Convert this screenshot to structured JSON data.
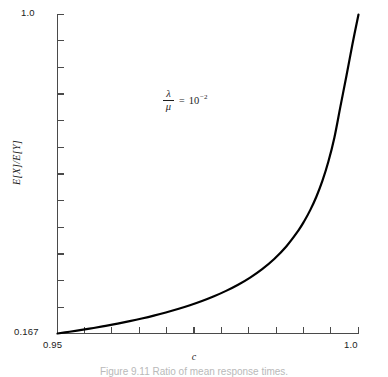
{
  "figure": {
    "caption": "Figure 9.11  Ratio of mean response times.",
    "annotation": {
      "numerator": "λ",
      "denominator": "μ",
      "equals": "=",
      "base": "10",
      "exponent": "−2",
      "full_text": "λ/μ = 10⁻²"
    }
  },
  "chart_data": {
    "type": "line",
    "title": "",
    "subtitle": "",
    "xlabel": "c",
    "ylabel": "E[X]/E[Y]",
    "xlim": [
      0.95,
      1.0
    ],
    "ylim": [
      0.167,
      1.0
    ],
    "x_tick_labels": [
      "0.95",
      "1.0"
    ],
    "y_tick_labels": [
      "0.167",
      "1.0"
    ],
    "x_tick_label_values": [
      0.95,
      1.0
    ],
    "y_tick_label_values": [
      0.167,
      1.0
    ],
    "x_minor_tick_count": 10,
    "y_minor_tick_count": 11,
    "grid": false,
    "legend": null,
    "legend_position": "none",
    "annotations": [
      {
        "text": "λ/μ = 10⁻²",
        "x": 0.973,
        "y": 0.8
      }
    ],
    "series": [
      {
        "name": "E[X]/E[Y]",
        "color": "#000000",
        "line_width": 2.2,
        "x": [
          0.95,
          0.952,
          0.954,
          0.956,
          0.958,
          0.96,
          0.962,
          0.964,
          0.966,
          0.968,
          0.97,
          0.972,
          0.974,
          0.976,
          0.978,
          0.98,
          0.982,
          0.984,
          0.986,
          0.988,
          0.99,
          0.991,
          0.992,
          0.993,
          0.994,
          0.995,
          0.996,
          0.997,
          0.998,
          0.999,
          1.0
        ],
        "y": [
          0.167,
          0.1715,
          0.1763,
          0.1814,
          0.1869,
          0.1928,
          0.1992,
          0.2061,
          0.2136,
          0.2218,
          0.2308,
          0.2407,
          0.2518,
          0.2642,
          0.2783,
          0.2944,
          0.3131,
          0.3352,
          0.3617,
          0.3944,
          0.4357,
          0.4607,
          0.4898,
          0.5242,
          0.5655,
          0.616,
          0.679,
          0.76,
          0.84,
          0.923,
          1.0
        ]
      }
    ]
  },
  "axes": {
    "y_top_label": "1.0",
    "y_bottom_label": "0.167",
    "x_left_label": "0.95",
    "x_right_label": "1.0",
    "y_title": "E[X]/E[Y]",
    "x_title": "c"
  }
}
